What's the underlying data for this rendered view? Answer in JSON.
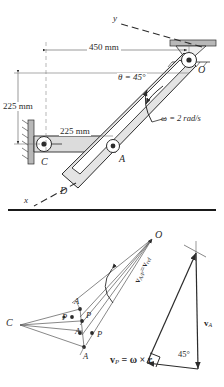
{
  "figure": {
    "type": "engineering-kinematics-diagram",
    "panels": [
      "mechanism",
      "velocity-polygon"
    ]
  },
  "mechanism": {
    "dim_horizontal": "450 mm",
    "dim_vertical": "225 mm",
    "dim_arm": "225 mm",
    "angle_label": "θ = 45°",
    "omega_label": "ω = 2 rad/s",
    "axis_y": "y",
    "axis_x": "x",
    "point_O": "O",
    "point_C": "C",
    "point_A": "A",
    "point_D": "D"
  },
  "velocity": {
    "point_O": "O",
    "point_C": "C",
    "labels_A": [
      "A",
      "A",
      "A"
    ],
    "labels_P": [
      "P",
      "P",
      "P"
    ],
    "rel_velocity": "v",
    "rel_velocity_sub1": "A/P",
    "rel_velocity_eq": "=",
    "rel_velocity_sub2": "rel",
    "rel_velocity_v2": "v",
    "v_A": "v",
    "v_A_sub": "A",
    "angle_45": "45°",
    "equation_v": "v",
    "equation_sub": "P",
    "equation_rest": "= ω × r"
  },
  "colors": {
    "line": "#2b2b2b",
    "fill_gray": "#d9d9d9",
    "hatch": "#8a8a8a",
    "divider": "#1a1a1a"
  }
}
